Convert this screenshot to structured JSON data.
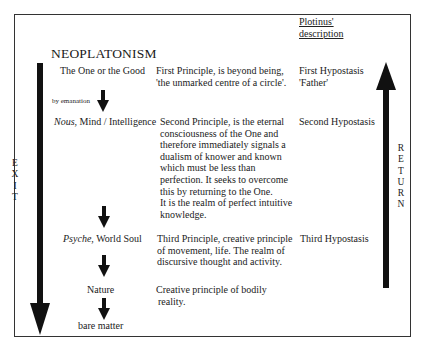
{
  "title": "NEOPLATONISM",
  "column_header": {
    "line1": "Plotinus'",
    "line2": "description"
  },
  "side_labels": {
    "left": [
      "E",
      "X",
      "I",
      "T"
    ],
    "right": [
      "R",
      "E",
      "T",
      "U",
      "R",
      "N"
    ]
  },
  "emanation_label": "by emanation",
  "levels": [
    {
      "name_italic": "",
      "name": "The One or the Good",
      "principle": [
        "First Principle, is beyond being,",
        "'the unmarked centre of a circle'."
      ],
      "plotinus": [
        "First Hypostasis",
        "'Father'"
      ]
    },
    {
      "name_italic": "Nous",
      "name": ", Mind / Intelligence",
      "principle": [
        "Second Principle, is the eternal",
        "consciousness of the One and",
        "therefore immediately signals a",
        "dualism of knower and known",
        "which must be less than",
        "perfection. It seeks to overcome",
        "this by returning to the One.",
        "It is the realm of perfect intuitive",
        "knowledge."
      ],
      "plotinus": [
        "Second Hypostasis"
      ]
    },
    {
      "name_italic": "Psyche",
      "name": ", World Soul",
      "principle": [
        "Third Principle, creative principle",
        "of movement, life. The realm of",
        "discursive thought and activity."
      ],
      "plotinus": [
        "Third Hypostasis"
      ]
    },
    {
      "name_italic": "",
      "name": "Nature",
      "principle": [
        "Creative principle of bodily",
        "reality."
      ],
      "plotinus": []
    },
    {
      "name_italic": "",
      "name": "bare matter",
      "principle": [],
      "plotinus": []
    }
  ],
  "colors": {
    "frame": "#333333",
    "arrow": "#111111",
    "text": "#222222"
  }
}
